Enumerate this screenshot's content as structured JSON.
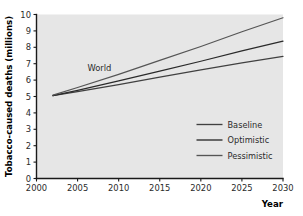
{
  "chart_data": {
    "type": "line",
    "title": "",
    "xlabel": "Year",
    "ylabel": "Tobacco-caused deaths (millions)",
    "xlim": [
      2000,
      2030
    ],
    "ylim": [
      0,
      10
    ],
    "grid": false,
    "legend_position": "inside-lower-right",
    "x_ticks": [
      2000,
      2005,
      2010,
      2015,
      2020,
      2025,
      2030
    ],
    "y_ticks": [
      0,
      1,
      2,
      3,
      4,
      5,
      6,
      7,
      8,
      9,
      10
    ],
    "x_tick_labels": [
      "2000",
      "2005",
      "2010",
      "2015",
      "2020",
      "2025",
      "2030"
    ],
    "y_tick_labels": [
      "0",
      "1",
      "2",
      "3",
      "4",
      "5",
      "6",
      "7",
      "8",
      "9",
      "10"
    ],
    "annotations": [
      {
        "text": "World",
        "x": 2006.2,
        "y": 6.55
      }
    ],
    "x": [
      2002,
      2005,
      2010,
      2015,
      2020,
      2025,
      2030
    ],
    "series": [
      {
        "name": "Baseline",
        "color": "#404040",
        "values": [
          5.05,
          5.3,
          5.72,
          6.18,
          6.62,
          7.05,
          7.45
        ]
      },
      {
        "name": "Optimistic",
        "color": "#2a2a2a",
        "values": [
          5.05,
          5.38,
          5.95,
          6.55,
          7.15,
          7.78,
          8.38
        ]
      },
      {
        "name": "Pessimistic",
        "color": "#555555",
        "values": [
          5.08,
          5.55,
          6.35,
          7.2,
          8.05,
          8.95,
          9.8
        ]
      }
    ]
  },
  "legend": {
    "entries": [
      {
        "label": "Baseline"
      },
      {
        "label": "Optimistic"
      },
      {
        "label": "Pessimistic"
      }
    ]
  },
  "style": {
    "plot_background": "#e6e6e6",
    "page_background": "#ffffff",
    "axis_color": "#1a1a1a",
    "text_color": "#2b2b2b"
  }
}
